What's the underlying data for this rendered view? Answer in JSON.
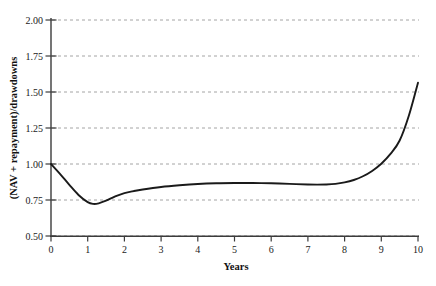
{
  "chart_data": {
    "type": "line",
    "title": "",
    "xlabel": "Years",
    "ylabel": "(NAV + repayment)/drawdowns",
    "xlim": [
      0,
      10
    ],
    "ylim": [
      0.5,
      2.0
    ],
    "grid": true,
    "grid_axis": "y",
    "legend": false,
    "x_ticks": [
      "0",
      "1",
      "2",
      "3",
      "4",
      "5",
      "6",
      "7",
      "8",
      "9",
      "10"
    ],
    "x_tick_values": [
      0,
      1,
      2,
      3,
      4,
      5,
      6,
      7,
      8,
      9,
      10
    ],
    "y_ticks": [
      "0.50",
      "0.75",
      "1.00",
      "1.25",
      "1.50",
      "1.75",
      "2.00"
    ],
    "y_tick_values": [
      0.5,
      0.75,
      1.0,
      1.25,
      1.5,
      1.75,
      2.0
    ],
    "series": [
      {
        "name": "J-curve",
        "color": "#1a1a1a",
        "x": [
          0.0,
          0.25,
          0.5,
          0.75,
          1.0,
          1.15,
          1.3,
          1.5,
          1.75,
          2.0,
          2.25,
          2.5,
          3.0,
          3.5,
          4.0,
          4.5,
          5.0,
          5.5,
          6.0,
          6.5,
          7.0,
          7.25,
          7.5,
          7.75,
          8.0,
          8.25,
          8.5,
          8.75,
          9.0,
          9.25,
          9.5,
          9.75,
          10.0
        ],
        "values": [
          1.0,
          0.93,
          0.855,
          0.785,
          0.735,
          0.723,
          0.727,
          0.745,
          0.775,
          0.798,
          0.812,
          0.823,
          0.84,
          0.852,
          0.861,
          0.866,
          0.868,
          0.868,
          0.866,
          0.862,
          0.858,
          0.857,
          0.858,
          0.862,
          0.872,
          0.889,
          0.915,
          0.952,
          1.002,
          1.07,
          1.163,
          1.335,
          1.565
        ]
      }
    ],
    "annotations": []
  },
  "axis": {
    "y_title": "(NAV + repayment)/drawdowns",
    "x_title": "Years"
  }
}
